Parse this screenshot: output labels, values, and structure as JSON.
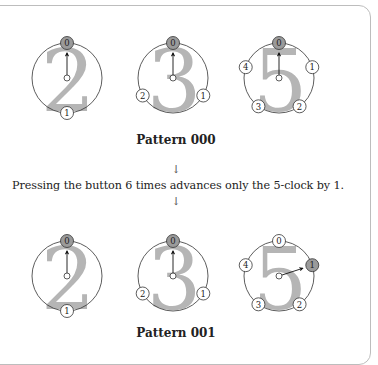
{
  "colors": {
    "line": "#333333",
    "digit": "#b5b5b5",
    "active_node": "#9a9a9a",
    "node": "#ffffff",
    "frame": "#bdbdbd"
  },
  "patterns": [
    {
      "caption": "Pattern 000",
      "clocks": [
        {
          "modulus": "2",
          "nodes": [
            "0",
            "1"
          ],
          "hand_at": 0
        },
        {
          "modulus": "3",
          "nodes": [
            "0",
            "1",
            "2"
          ],
          "hand_at": 0
        },
        {
          "modulus": "5",
          "nodes": [
            "0",
            "1",
            "2",
            "3",
            "4"
          ],
          "hand_at": 0
        }
      ]
    },
    {
      "caption": "Pattern 001",
      "clocks": [
        {
          "modulus": "2",
          "nodes": [
            "0",
            "1"
          ],
          "hand_at": 0
        },
        {
          "modulus": "3",
          "nodes": [
            "0",
            "1",
            "2"
          ],
          "hand_at": 0
        },
        {
          "modulus": "5",
          "nodes": [
            "0",
            "1",
            "2",
            "3",
            "4"
          ],
          "hand_at": 1
        }
      ]
    }
  ],
  "transition": {
    "arrow_top": "↓",
    "text": "Pressing the button 6 times advances only the 5-clock by 1.",
    "arrow_bottom": "↓"
  }
}
